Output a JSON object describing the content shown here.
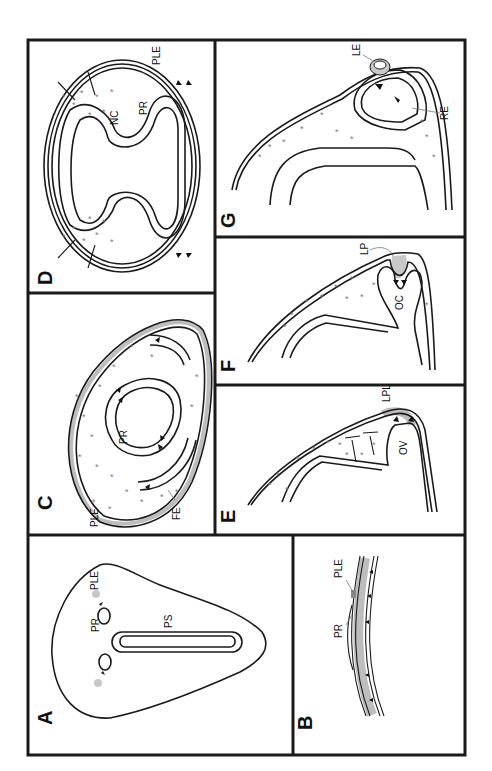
{
  "figure": {
    "orientation": "rotated-90-ccw",
    "panels": [
      {
        "id": "A",
        "label": "A",
        "annotations": [
          "PLE",
          "PR",
          "PS"
        ]
      },
      {
        "id": "B",
        "label": "B",
        "annotations": [
          "PLE",
          "PR"
        ]
      },
      {
        "id": "C",
        "label": "C",
        "annotations": [
          "PLE",
          "PR",
          "FE"
        ]
      },
      {
        "id": "D",
        "label": "D",
        "annotations": [
          "NC",
          "PR",
          "PLE"
        ]
      },
      {
        "id": "E",
        "label": "E",
        "annotations": [
          "LPL",
          "OV"
        ]
      },
      {
        "id": "F",
        "label": "F",
        "annotations": [
          "LP",
          "OC"
        ]
      },
      {
        "id": "G",
        "label": "G",
        "annotations": [
          "LE",
          "RE"
        ]
      }
    ]
  },
  "labels": {
    "A": "A",
    "B": "B",
    "C": "C",
    "D": "D",
    "E": "E",
    "F": "F",
    "G": "G",
    "a_ple": "PLE",
    "a_pr": "PR",
    "a_ps": "PS",
    "b_ple": "PLE",
    "b_pr": "PR",
    "c_ple": "PLE",
    "c_pr": "PR",
    "c_fe": "FE",
    "d_nc": "NC",
    "d_pr": "PR",
    "d_ple": "PLE",
    "e_lpl": "LPL",
    "e_ov": "OV",
    "f_lp": "LP",
    "f_oc": "OC",
    "g_le": "LE",
    "g_re": "RE"
  },
  "colors": {
    "stroke": "#1a1a1a",
    "placode_grey": "#c8c8c8",
    "mesenchyme_star": "#7a7a7a"
  }
}
